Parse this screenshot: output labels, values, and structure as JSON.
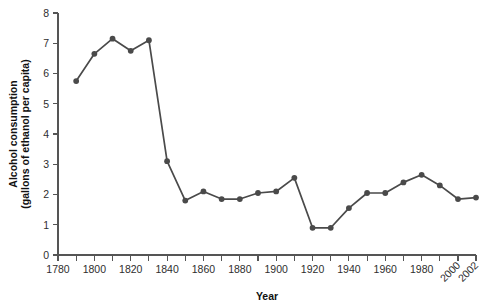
{
  "chart_data": {
    "type": "line",
    "title": "",
    "xlabel": "Year",
    "ylabel": "Alcohol consumption (gallons of ethanol per capita)",
    "ylabel_line1": "Alcohol consumption",
    "ylabel_line2": "(gallons of ethanol per capita)",
    "xlim": [
      1780,
      2002
    ],
    "ylim": [
      0,
      8
    ],
    "grid": false,
    "legend": "none",
    "line_color": "#4a4a4a",
    "marker_color": "#4a4a4a",
    "axis_color": "#555555",
    "x_ticks": [
      1780,
      1790,
      1800,
      1810,
      1820,
      1830,
      1840,
      1850,
      1860,
      1870,
      1880,
      1890,
      1900,
      1910,
      1920,
      1930,
      1940,
      1950,
      1960,
      1970,
      1980,
      1990,
      2000,
      2002
    ],
    "x_tick_labels": [
      "1780",
      "",
      "1800",
      "",
      "1820",
      "",
      "1840",
      "",
      "1860",
      "",
      "1880",
      "",
      "1900",
      "",
      "1920",
      "",
      "1940",
      "",
      "1960",
      "",
      "1980",
      "",
      "2000",
      "2002"
    ],
    "x_rotated_labels": [
      "2000",
      "2002"
    ],
    "y_ticks": [
      0,
      1,
      2,
      3,
      4,
      5,
      6,
      7,
      8
    ],
    "y_tick_labels": [
      "0",
      "1",
      "2",
      "3",
      "4",
      "5",
      "6",
      "7",
      "8"
    ],
    "x": [
      1790,
      1800,
      1810,
      1820,
      1830,
      1840,
      1850,
      1860,
      1870,
      1880,
      1890,
      1900,
      1910,
      1920,
      1930,
      1940,
      1950,
      1960,
      1970,
      1980,
      1990,
      2000,
      2002
    ],
    "values": [
      5.75,
      6.65,
      7.15,
      6.75,
      7.1,
      3.1,
      1.8,
      2.1,
      1.85,
      1.85,
      2.05,
      2.1,
      2.55,
      0.9,
      0.9,
      1.55,
      2.05,
      2.05,
      2.4,
      2.65,
      2.3,
      1.85,
      1.9
    ],
    "series": [
      {
        "name": "Alcohol consumption",
        "x": [
          1790,
          1800,
          1810,
          1820,
          1830,
          1840,
          1850,
          1860,
          1870,
          1880,
          1890,
          1900,
          1910,
          1920,
          1930,
          1940,
          1950,
          1960,
          1970,
          1980,
          1990,
          2000,
          2002
        ],
        "values": [
          5.75,
          6.65,
          7.15,
          6.75,
          7.1,
          3.1,
          1.8,
          2.1,
          1.85,
          1.85,
          2.05,
          2.1,
          2.55,
          0.9,
          0.9,
          1.55,
          2.05,
          2.05,
          2.4,
          2.65,
          2.3,
          1.85,
          1.9
        ]
      }
    ]
  }
}
